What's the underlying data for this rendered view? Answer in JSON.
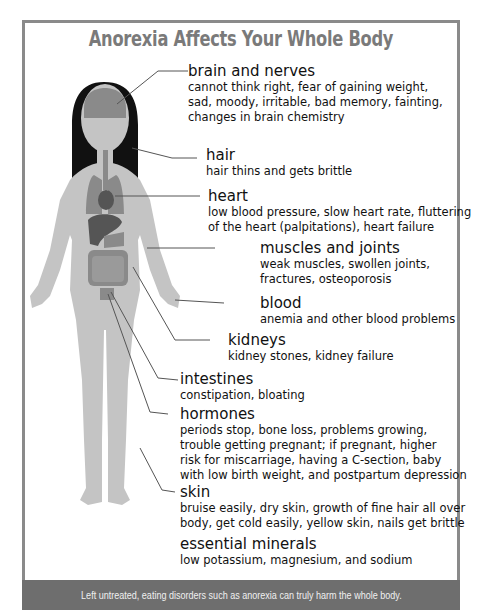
{
  "title": "Anorexia Affects Your Whole Body",
  "footer": "Left untreated, eating disorders such as anorexia can truly harm the whole body.",
  "colors": {
    "frame": "#8a8a8a",
    "title": "#7a7a7a",
    "footer_bg": "#6e6e6e",
    "body": "#c4c4c4",
    "hair": "#111111",
    "organ": "#8a8a8a",
    "organ_dark": "#555555"
  },
  "sections": [
    {
      "heading": "brain and nerves",
      "lines": [
        "cannot think right, fear of gaining weight,",
        "sad, moody, irritable, bad memory, fainting,",
        "changes in brain chemistry"
      ]
    },
    {
      "heading": "hair",
      "lines": [
        "hair thins and gets brittle"
      ]
    },
    {
      "heading": "heart",
      "lines": [
        "low blood pressure, slow heart rate, fluttering",
        "of the heart (palpitations), heart failure"
      ]
    },
    {
      "heading": "muscles and joints",
      "lines": [
        "weak muscles, swollen joints,",
        "fractures, osteoporosis"
      ]
    },
    {
      "heading": "blood",
      "lines": [
        "anemia and other blood problems"
      ]
    },
    {
      "heading": "kidneys",
      "lines": [
        "kidney stones, kidney failure"
      ]
    },
    {
      "heading": "intestines",
      "lines": [
        "constipation, bloating"
      ]
    },
    {
      "heading": "hormones",
      "lines": [
        "periods stop, bone loss, problems growing,",
        "trouble getting pregnant; if pregnant, higher",
        "risk for miscarriage, having a C-section, baby",
        "with low birth weight, and postpartum depression"
      ]
    },
    {
      "heading": "skin",
      "lines": [
        "bruise easily, dry skin, growth of fine hair all over",
        "body, get cold easily, yellow skin, nails get brittle"
      ]
    },
    {
      "heading": "essential minerals",
      "lines": [
        "low potassium, magnesium, and sodium"
      ]
    }
  ]
}
